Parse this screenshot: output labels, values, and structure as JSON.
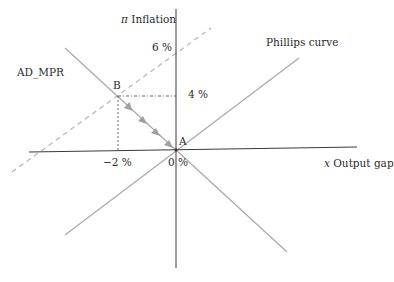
{
  "diagram": {
    "y_axis": {
      "symbol": "π",
      "label": "Inflation"
    },
    "x_axis": {
      "symbol": "x",
      "label": "Output gap"
    },
    "curves": {
      "phillips": "Phillips curve",
      "ad_mpr": "AD_MPR"
    },
    "points": {
      "A": "A",
      "B": "B"
    },
    "ticks": {
      "y_6": "6 %",
      "y_4": "4 %",
      "x_neg2": "−2 %",
      "origin": "0 %"
    },
    "colors": {
      "axis": "#3a3a3a",
      "curve": "#a8a8a8",
      "dashed": "#b5b5b5",
      "arrow": "#a0a0a0",
      "guide": "#444444"
    }
  }
}
